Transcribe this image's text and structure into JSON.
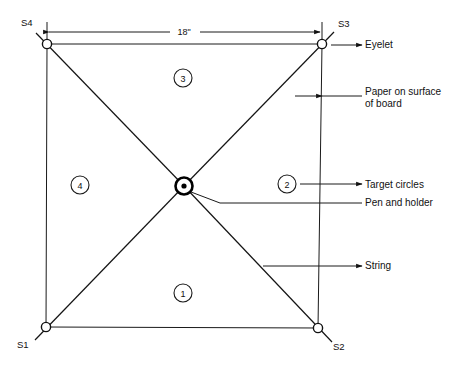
{
  "diagram": {
    "dimension": {
      "value": "18\"",
      "from_x": 47,
      "to_x": 322,
      "y": 32
    },
    "corners": [
      {
        "id": "S1",
        "label": "S1",
        "x": 46,
        "y": 327,
        "label_x": 17,
        "label_y": 348
      },
      {
        "id": "S2",
        "label": "S2",
        "x": 318,
        "y": 328,
        "label_x": 333,
        "label_y": 350
      },
      {
        "id": "S3",
        "label": "S3",
        "x": 322,
        "y": 44,
        "label_x": 338,
        "label_y": 27
      },
      {
        "id": "S4",
        "label": "S4",
        "x": 47,
        "y": 44,
        "label_x": 21,
        "label_y": 26
      }
    ],
    "center": {
      "x": 184,
      "y": 186,
      "outer_r": 8.5,
      "dot_r": 2.6
    },
    "zones": [
      {
        "label": "1",
        "x": 183,
        "y": 293,
        "r": 9
      },
      {
        "label": "2",
        "x": 287,
        "y": 184,
        "r": 9
      },
      {
        "label": "3",
        "x": 183,
        "y": 78,
        "r": 9
      },
      {
        "label": "4",
        "x": 80,
        "y": 185,
        "r": 9
      }
    ],
    "callouts": [
      {
        "name": "eyelet",
        "label": "Eyelet",
        "text_x": 365,
        "text_y": 48,
        "leader_from_x": 462,
        "leader_to_x": 330,
        "leader_y": 45,
        "arrow": true
      },
      {
        "name": "paper-on-board",
        "label_line1": "Paper on surface",
        "label_line2": "of board",
        "text_x": 365,
        "text_y": 95,
        "text_y2": 107,
        "leader_from_x": 462,
        "leader_to_x": 293,
        "leader_y": 96,
        "arrow": true
      },
      {
        "name": "target-circles",
        "label": "Target circles",
        "text_x": 365,
        "text_y": 188,
        "leader_from_x": 462,
        "leader_to_x": 299,
        "leader_y": 184,
        "arrow": true
      },
      {
        "name": "pen-and-holder",
        "label": "Pen and holder",
        "text_x": 365,
        "text_y": 206,
        "leader_from_x": 462,
        "leader_to_x": 218,
        "leader_y": 203,
        "arrow": false
      },
      {
        "name": "string",
        "label": "String",
        "text_x": 365,
        "text_y": 269,
        "leader_from_x": 462,
        "leader_to_x": 262,
        "leader_y": 266,
        "arrow": true
      }
    ],
    "colors": {
      "ink": "#111111",
      "paper": "#ffffff"
    }
  }
}
